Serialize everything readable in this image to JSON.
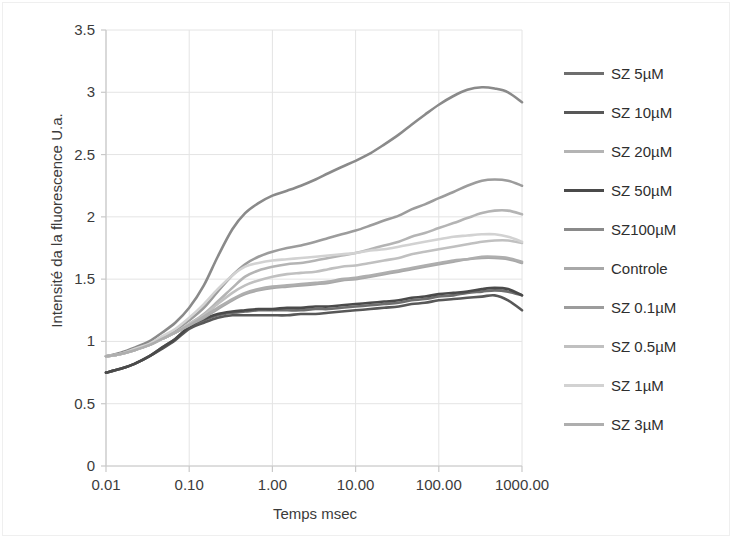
{
  "chart_data": {
    "type": "line",
    "title": "",
    "xlabel": "Temps msec",
    "ylabel": "Intensité da la fluorescence U.a.",
    "xscale": "log",
    "xlim": [
      0.01,
      1000
    ],
    "ylim": [
      0,
      3.5
    ],
    "xticks": [
      "0.01",
      "0.10",
      "1.00",
      "10.00",
      "100.00",
      "1000.00"
    ],
    "xtick_values": [
      0.01,
      0.1,
      1,
      10,
      100,
      1000
    ],
    "yticks": [
      "0",
      "0.5",
      "1",
      "1.5",
      "2",
      "2.5",
      "3",
      "3.5"
    ],
    "ytick_values": [
      0,
      0.5,
      1,
      1.5,
      2,
      2.5,
      3,
      3.5
    ],
    "grid": true,
    "legend_position": "right",
    "x": [
      0.01,
      0.015,
      0.022,
      0.033,
      0.047,
      0.068,
      0.1,
      0.15,
      0.22,
      0.33,
      0.47,
      0.68,
      1.0,
      1.5,
      2.2,
      3.3,
      4.7,
      6.8,
      10,
      15,
      22,
      33,
      47,
      68,
      100,
      150,
      220,
      330,
      470,
      680,
      1000
    ],
    "series": [
      {
        "name": "SZ 5µM",
        "color": "#6e6e6e",
        "values": [
          0.75,
          0.78,
          0.82,
          0.88,
          0.95,
          1.02,
          1.11,
          1.17,
          1.21,
          1.23,
          1.24,
          1.25,
          1.25,
          1.25,
          1.25,
          1.26,
          1.26,
          1.27,
          1.28,
          1.29,
          1.3,
          1.31,
          1.33,
          1.34,
          1.36,
          1.37,
          1.39,
          1.4,
          1.41,
          1.4,
          1.37
        ]
      },
      {
        "name": "SZ 10µM",
        "color": "#585858",
        "values": [
          0.75,
          0.78,
          0.82,
          0.88,
          0.94,
          1.01,
          1.1,
          1.15,
          1.19,
          1.21,
          1.21,
          1.21,
          1.21,
          1.21,
          1.22,
          1.22,
          1.23,
          1.24,
          1.25,
          1.26,
          1.27,
          1.28,
          1.3,
          1.31,
          1.33,
          1.34,
          1.35,
          1.36,
          1.37,
          1.33,
          1.25
        ]
      },
      {
        "name": "SZ 20µM",
        "color": "#b4b4b4",
        "values": [
          0.88,
          0.9,
          0.93,
          0.97,
          1.02,
          1.07,
          1.14,
          1.22,
          1.32,
          1.43,
          1.52,
          1.57,
          1.6,
          1.62,
          1.63,
          1.65,
          1.67,
          1.69,
          1.71,
          1.74,
          1.77,
          1.8,
          1.84,
          1.87,
          1.91,
          1.95,
          1.99,
          2.03,
          2.05,
          2.05,
          2.02
        ]
      },
      {
        "name": "SZ 50µM",
        "color": "#4a4a4a",
        "values": [
          0.75,
          0.78,
          0.82,
          0.88,
          0.95,
          1.02,
          1.12,
          1.18,
          1.22,
          1.24,
          1.25,
          1.26,
          1.26,
          1.27,
          1.27,
          1.28,
          1.28,
          1.29,
          1.3,
          1.31,
          1.32,
          1.33,
          1.35,
          1.36,
          1.38,
          1.39,
          1.4,
          1.42,
          1.43,
          1.42,
          1.37
        ]
      },
      {
        "name": "SZ100µM",
        "color": "#8a8a8a",
        "values": [
          0.88,
          0.91,
          0.95,
          1.0,
          1.07,
          1.15,
          1.27,
          1.45,
          1.68,
          1.9,
          2.03,
          2.11,
          2.17,
          2.21,
          2.25,
          2.3,
          2.35,
          2.4,
          2.45,
          2.51,
          2.58,
          2.66,
          2.74,
          2.82,
          2.9,
          2.97,
          3.02,
          3.04,
          3.03,
          3.0,
          2.92
        ]
      },
      {
        "name": "Controle",
        "color": "#a8a8a8",
        "values": [
          0.88,
          0.9,
          0.93,
          0.97,
          1.02,
          1.07,
          1.13,
          1.19,
          1.26,
          1.33,
          1.38,
          1.41,
          1.43,
          1.44,
          1.45,
          1.46,
          1.47,
          1.49,
          1.5,
          1.52,
          1.54,
          1.56,
          1.58,
          1.6,
          1.62,
          1.64,
          1.66,
          1.67,
          1.67,
          1.66,
          1.63
        ]
      },
      {
        "name": "SZ 0.1µM",
        "color": "#9c9c9c",
        "values": [
          0.88,
          0.9,
          0.94,
          0.98,
          1.03,
          1.09,
          1.17,
          1.27,
          1.4,
          1.53,
          1.62,
          1.68,
          1.72,
          1.75,
          1.77,
          1.8,
          1.83,
          1.86,
          1.89,
          1.93,
          1.97,
          2.01,
          2.06,
          2.1,
          2.15,
          2.2,
          2.25,
          2.29,
          2.3,
          2.29,
          2.25
        ]
      },
      {
        "name": "SZ 0.5µM",
        "color": "#c0c0c0",
        "values": [
          0.88,
          0.9,
          0.93,
          0.97,
          1.02,
          1.07,
          1.14,
          1.21,
          1.3,
          1.39,
          1.45,
          1.49,
          1.52,
          1.54,
          1.55,
          1.56,
          1.58,
          1.6,
          1.61,
          1.63,
          1.65,
          1.67,
          1.7,
          1.72,
          1.74,
          1.76,
          1.78,
          1.8,
          1.81,
          1.81,
          1.79
        ]
      },
      {
        "name": "SZ 1µM",
        "color": "#d2d2d2",
        "values": [
          0.88,
          0.9,
          0.94,
          0.98,
          1.04,
          1.1,
          1.19,
          1.3,
          1.42,
          1.53,
          1.6,
          1.63,
          1.65,
          1.66,
          1.67,
          1.68,
          1.69,
          1.7,
          1.71,
          1.73,
          1.74,
          1.76,
          1.78,
          1.8,
          1.82,
          1.84,
          1.85,
          1.86,
          1.86,
          1.84,
          1.8
        ]
      },
      {
        "name": "SZ 3µM",
        "color": "#aeaeae",
        "values": [
          0.88,
          0.9,
          0.93,
          0.97,
          1.02,
          1.07,
          1.13,
          1.2,
          1.27,
          1.34,
          1.39,
          1.42,
          1.44,
          1.45,
          1.46,
          1.47,
          1.48,
          1.5,
          1.51,
          1.53,
          1.55,
          1.57,
          1.59,
          1.61,
          1.63,
          1.65,
          1.66,
          1.68,
          1.68,
          1.67,
          1.64
        ]
      }
    ]
  },
  "legend": {
    "items": [
      {
        "label": "SZ 5µM"
      },
      {
        "label": "SZ 10µM"
      },
      {
        "label": "SZ 20µM"
      },
      {
        "label": "SZ 50µM"
      },
      {
        "label": "SZ100µM"
      },
      {
        "label": "Controle"
      },
      {
        "label": "SZ 0.1µM"
      },
      {
        "label": "SZ 0.5µM"
      },
      {
        "label": "SZ 1µM"
      },
      {
        "label": "SZ 3µM"
      }
    ]
  },
  "axes": {
    "x_title": "Temps msec",
    "y_title": "Intensité da la fluorescence U.a."
  },
  "colors": {
    "axis": "#c9c9c9",
    "grid": "#e4e4e4",
    "tick_text": "#3b3b3b"
  }
}
